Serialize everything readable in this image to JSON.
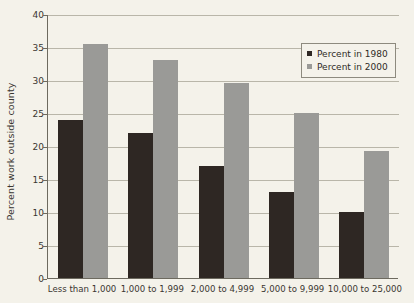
{
  "chart_data": {
    "type": "bar",
    "title": "",
    "xlabel": "",
    "ylabel": "Percent work outside county",
    "ylim": [
      0,
      40
    ],
    "yticks": [
      0,
      5,
      10,
      15,
      20,
      25,
      30,
      35,
      40
    ],
    "grid": true,
    "legend_position": "top-right",
    "categories": [
      "Less than 1,000",
      "1,000 to 1,999",
      "2,000 to 4,999",
      "5,000 to 9,999",
      "10,000 to 25,000"
    ],
    "series": [
      {
        "name": "Percent in 1980",
        "color": "#2e2723",
        "values": [
          24,
          22,
          17,
          13,
          10
        ]
      },
      {
        "name": "Percent in 2000",
        "color": "#9a9a97",
        "values": [
          35.4,
          33,
          29.5,
          25,
          19.2
        ]
      }
    ]
  },
  "legend": {
    "items": [
      {
        "label": "Percent in 1980"
      },
      {
        "label": "Percent in 2000"
      }
    ]
  },
  "colors": {
    "background": "#f4f2ea",
    "axis": "#6d6a5f",
    "gridline": "#b9b6a9",
    "series_1980": "#2e2723",
    "series_2000": "#9a9a97"
  }
}
